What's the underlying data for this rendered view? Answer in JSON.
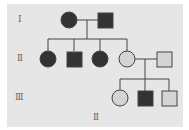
{
  "diagram": {
    "type": "pedigree",
    "generation_labels": [
      "I",
      "II",
      "III"
    ],
    "stray_label": "II",
    "colors": {
      "affected": "#333333",
      "unaffected": "#d4d4d4",
      "line": "#444444",
      "background": "#e6e6e6"
    },
    "individuals": [
      {
        "id": "I-1",
        "sex": "female",
        "affected": true
      },
      {
        "id": "I-2",
        "sex": "male",
        "affected": true
      },
      {
        "id": "II-1",
        "sex": "female",
        "affected": true
      },
      {
        "id": "II-2",
        "sex": "male",
        "affected": true
      },
      {
        "id": "II-3",
        "sex": "female",
        "affected": true
      },
      {
        "id": "II-4",
        "sex": "female",
        "affected": false
      },
      {
        "id": "II-5",
        "sex": "male",
        "affected": false
      },
      {
        "id": "III-1",
        "sex": "female",
        "affected": false
      },
      {
        "id": "III-2",
        "sex": "male",
        "affected": true
      },
      {
        "id": "III-3",
        "sex": "male",
        "affected": false
      }
    ]
  }
}
